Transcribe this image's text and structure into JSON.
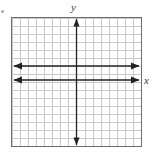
{
  "figure": {
    "width": 155,
    "height": 160,
    "background_color": "#ffffff"
  },
  "grid": {
    "left": 11,
    "top": 17,
    "width": 131,
    "height": 130,
    "columns": 16,
    "rows": 16,
    "cell_size": 8.2,
    "grid_line_color": "#c9c9c9",
    "border_color": "#6e6e6e",
    "border_width": 1,
    "tick_labels_shown": false,
    "numbers_shown": false
  },
  "axes": {
    "color": "#222222",
    "line_width": 1,
    "y_axis": {
      "name": "y-axis",
      "label": "y",
      "orientation": "vertical",
      "position_x": 76.5,
      "start_y": 17,
      "end_y": 147,
      "arrow_top": true,
      "arrow_bottom": true
    },
    "x_axis_upper": {
      "name": "upper-horizontal-axis",
      "label": "",
      "orientation": "horizontal",
      "position_y": 66,
      "start_x": 13,
      "end_x": 140,
      "arrow_left": true,
      "arrow_right": true
    },
    "x_axis_lower": {
      "name": "x-axis",
      "label": "x",
      "orientation": "horizontal",
      "position_y": 80,
      "start_x": 13,
      "end_x": 140,
      "arrow_left": true,
      "arrow_right": true
    }
  },
  "labels": {
    "y_label": "y",
    "x_label": "x",
    "label_color": "#3a3a3a",
    "label_style": "italic"
  },
  "marks": {
    "corner_dot": {
      "name": "corner-artifact-dot",
      "x": 1,
      "y": 10,
      "color": "#8d8d8d"
    }
  },
  "chart_data": {
    "type": "line",
    "xlabel": "x",
    "ylabel": "y",
    "grid": true,
    "legend": "none",
    "xlim": [
      -8,
      8
    ],
    "ylim": [
      -8,
      8
    ],
    "x_ticks": [
      -8,
      -7,
      -6,
      -5,
      -4,
      -3,
      -2,
      -1,
      0,
      1,
      2,
      3,
      4,
      5,
      6,
      7,
      8
    ],
    "y_ticks": [
      -8,
      -7,
      -6,
      -5,
      -4,
      -3,
      -2,
      -1,
      0,
      1,
      2,
      3,
      4,
      5,
      6,
      7,
      8
    ],
    "tick_labels_visible": false,
    "series": [
      {
        "name": "upper horizontal line",
        "equation": "y = 2",
        "x": [
          -8,
          8
        ],
        "values": [
          2,
          2
        ],
        "arrows_both_ends": true,
        "color": "#222222"
      },
      {
        "name": "x-axis (lower horizontal line)",
        "equation": "y = 0",
        "x": [
          -8,
          8
        ],
        "values": [
          0,
          0
        ],
        "arrows_both_ends": true,
        "color": "#222222"
      }
    ]
  }
}
